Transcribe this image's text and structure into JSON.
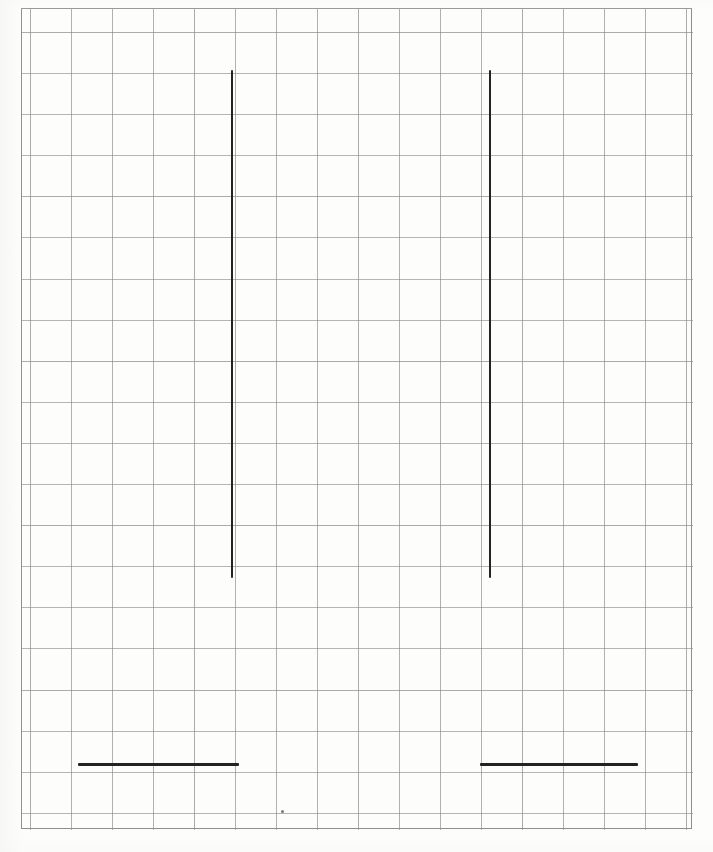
{
  "figure": {
    "kind": "hand-drawn-line-figure",
    "medium": "graph paper scan",
    "background_color": "#fdfdfc",
    "grid_color": "#7a7c7e",
    "stroke_color": "#24231f",
    "canvas": {
      "width": 713,
      "height": 852
    }
  },
  "grid": {
    "frame": {
      "x": 21,
      "y": 8,
      "width": 671,
      "height": 821
    },
    "cell_size_px": 41,
    "columns": 16,
    "rows": 20,
    "border_color": "#8c8e90"
  },
  "chart_data": {
    "type": "line",
    "title": "",
    "xlabel": "",
    "ylabel": "",
    "grid": true,
    "legend": null,
    "xlim": [
      21,
      692
    ],
    "ylim": [
      8,
      829
    ],
    "annotations": [
      {
        "name": "left-vertical-stroke",
        "orientation": "vertical",
        "x": 232,
        "y_start": 70,
        "y_end": 578,
        "length_px": 508,
        "thickness_px": 2,
        "color": "#24231f"
      },
      {
        "name": "right-vertical-stroke",
        "orientation": "vertical",
        "x": 490,
        "y_start": 70,
        "y_end": 578,
        "length_px": 508,
        "thickness_px": 2,
        "color": "#24231f"
      },
      {
        "name": "left-horizontal-stroke",
        "orientation": "horizontal",
        "y": 764,
        "x_start": 78,
        "x_end": 239,
        "length_px": 161,
        "thickness_px": 3,
        "color": "#24231f"
      },
      {
        "name": "right-horizontal-stroke",
        "orientation": "horizontal",
        "y": 764,
        "x_start": 480,
        "x_end": 638,
        "length_px": 158,
        "thickness_px": 3,
        "color": "#24231f"
      }
    ],
    "marks": [
      {
        "name": "paper-speck",
        "x": 281,
        "y": 810,
        "size_px": 3,
        "color": "#787876"
      }
    ]
  }
}
